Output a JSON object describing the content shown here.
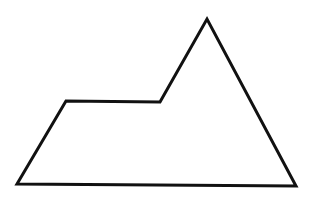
{
  "diagram": {
    "background": "#ffffff",
    "shape": {
      "type": "polygon",
      "description": "Irregular pentagon shaped like a mountain with a flat left shoulder",
      "stroke": "#111111",
      "stroke_width": 3,
      "fill": "none",
      "vertices": [
        {
          "name": "bottom-left",
          "x": 17,
          "y": 184
        },
        {
          "name": "left-shoulder",
          "x": 66,
          "y": 101
        },
        {
          "name": "inner-notch",
          "x": 160,
          "y": 102
        },
        {
          "name": "peak",
          "x": 207,
          "y": 19
        },
        {
          "name": "bottom-right",
          "x": 296,
          "y": 186
        }
      ]
    }
  }
}
